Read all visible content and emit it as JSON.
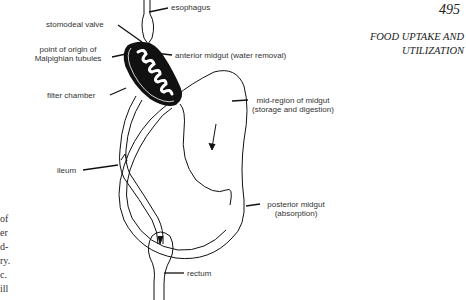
{
  "header": {
    "page_number": "495",
    "running_head_line1": "FOOD UPTAKE AND",
    "running_head_line2": "UTILIZATION"
  },
  "side_text": [
    "of",
    "er",
    "d-",
    "ry.",
    "c.",
    "ill"
  ],
  "diagram": {
    "labels": {
      "esophagus": "esophagus",
      "stomodeal_valve": "stomodeal valve",
      "malpighian_line1": "point of origin of",
      "malpighian_line2": "Malpighian tubules",
      "anterior_midgut": "anterior midgut (water removal)",
      "filter_chamber": "filter chamber",
      "mid_region_line1": "mid-region of midgut",
      "mid_region_line2": "(storage and digestion)",
      "ileum": "ileum",
      "posterior_midgut_line1": "posterior midgut",
      "posterior_midgut_line2": "(absorption)",
      "rectum": "rectum"
    }
  }
}
